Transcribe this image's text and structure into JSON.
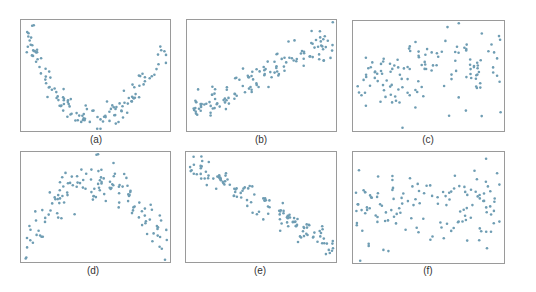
{
  "chart_data": [
    {
      "type": "scatter",
      "title": "",
      "caption": "(a)",
      "xlabel": "",
      "ylabel": "",
      "xlim": [
        0,
        1
      ],
      "ylim": [
        0,
        1
      ],
      "grid": false,
      "pattern": "curved U-shape (nonlinear, strong)",
      "seed": 11,
      "shape": "u"
    },
    {
      "type": "scatter",
      "title": "",
      "caption": "(b)",
      "xlabel": "",
      "ylabel": "",
      "xlim": [
        0,
        1
      ],
      "ylim": [
        0,
        1
      ],
      "grid": false,
      "pattern": "strong positive linear",
      "seed": 23,
      "shape": "pos"
    },
    {
      "type": "scatter",
      "title": "",
      "caption": "(c)",
      "xlabel": "",
      "ylabel": "",
      "xlim": [
        0,
        1
      ],
      "ylim": [
        0,
        1
      ],
      "grid": false,
      "pattern": "weak positive",
      "seed": 37,
      "shape": "weakpos"
    },
    {
      "type": "scatter",
      "title": "",
      "caption": "(d)",
      "xlabel": "",
      "ylabel": "",
      "xlim": [
        0,
        1
      ],
      "ylim": [
        0,
        1
      ],
      "grid": false,
      "pattern": "inverted U-shape (nonlinear)",
      "seed": 41,
      "shape": "arch"
    },
    {
      "type": "scatter",
      "title": "",
      "caption": "(e)",
      "xlabel": "",
      "ylabel": "",
      "xlim": [
        0,
        1
      ],
      "ylim": [
        0,
        1
      ],
      "grid": false,
      "pattern": "strong negative linear",
      "seed": 53,
      "shape": "neg"
    },
    {
      "type": "scatter",
      "title": "",
      "caption": "(f)",
      "xlabel": "",
      "ylabel": "",
      "xlim": [
        0,
        1
      ],
      "ylim": [
        0,
        1
      ],
      "grid": false,
      "pattern": "no association",
      "seed": 67,
      "shape": "none"
    }
  ],
  "colors": {
    "point": "#6f9db3",
    "frame": "#9a9a9a",
    "caption": "#333333"
  }
}
